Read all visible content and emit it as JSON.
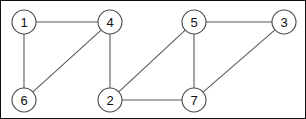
{
  "figure": {
    "kind": "undirected-graph",
    "width": 306,
    "height": 119,
    "background_color": "#ffffff",
    "frame_color": "#101010",
    "node_fill_color": "#ffffff",
    "node_stroke_color": "#4a4a4a",
    "edge_color": "#5a5a5a",
    "label_color": "#111111",
    "node_radius": 12
  },
  "nodes": [
    {
      "id": "1",
      "label": "1",
      "x": 23,
      "y": 21
    },
    {
      "id": "4",
      "label": "4",
      "x": 109,
      "y": 21
    },
    {
      "id": "5",
      "label": "5",
      "x": 193,
      "y": 21
    },
    {
      "id": "3",
      "label": "3",
      "x": 283,
      "y": 21
    },
    {
      "id": "6",
      "label": "6",
      "x": 23,
      "y": 99
    },
    {
      "id": "2",
      "label": "2",
      "x": 109,
      "y": 99
    },
    {
      "id": "7",
      "label": "7",
      "x": 193,
      "y": 99
    }
  ],
  "edges": [
    {
      "id": "e-1-4",
      "source": "1",
      "target": "4"
    },
    {
      "id": "e-1-6",
      "source": "1",
      "target": "6"
    },
    {
      "id": "e-6-4",
      "source": "6",
      "target": "4"
    },
    {
      "id": "e-4-2",
      "source": "4",
      "target": "2"
    },
    {
      "id": "e-2-5",
      "source": "2",
      "target": "5"
    },
    {
      "id": "e-2-7",
      "source": "2",
      "target": "7"
    },
    {
      "id": "e-5-7",
      "source": "5",
      "target": "7"
    },
    {
      "id": "e-5-3",
      "source": "5",
      "target": "3"
    },
    {
      "id": "e-3-7",
      "source": "3",
      "target": "7"
    }
  ]
}
